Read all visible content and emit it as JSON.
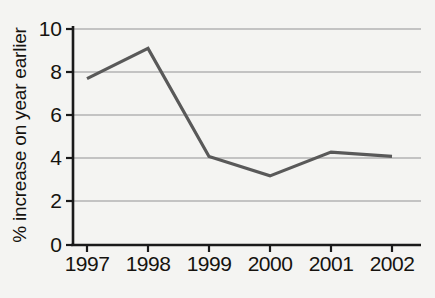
{
  "chart_data": {
    "type": "line",
    "title": "",
    "xlabel": "",
    "ylabel": "% increase on year earlier",
    "categories": [
      "1997",
      "1998",
      "1999",
      "2000",
      "2001",
      "2002"
    ],
    "values": [
      7.7,
      9.1,
      4.1,
      3.2,
      4.3,
      4.1
    ],
    "series": [
      {
        "name": "% increase on year earlier",
        "values": [
          7.7,
          9.1,
          4.1,
          3.2,
          4.3,
          4.1
        ]
      }
    ],
    "ylim": [
      0,
      10
    ],
    "yticks": [
      0,
      2,
      4,
      6,
      8,
      10
    ],
    "ytick_labels": [
      "0",
      "2",
      "4",
      "6",
      "8",
      "10"
    ],
    "xtick_labels": [
      "1997",
      "1998",
      "1999",
      "2000",
      "2001",
      "2002"
    ],
    "grid": true,
    "grid_axis": "y",
    "legend": false,
    "legend_position": "none",
    "markers": false,
    "colors": {
      "line": "#595959",
      "grid": "#b3b3b3",
      "axis": "#1a1a1a",
      "text": "#16130f",
      "background": "#f4f4f2"
    }
  }
}
